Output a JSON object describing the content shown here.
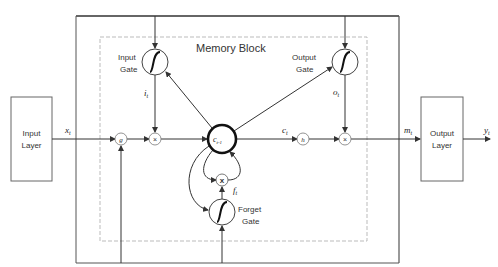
{
  "diagram": {
    "title": "Memory Block",
    "input_layer": {
      "line1": "Input",
      "line2": "Layer"
    },
    "output_layer": {
      "line1": "Output",
      "line2": "Layer"
    },
    "input_gate": {
      "line1": "Input",
      "line2": "Gate",
      "signal": "i",
      "sub": "t"
    },
    "output_gate": {
      "line1": "Output",
      "line2": "Gate",
      "signal": "o",
      "sub": "t"
    },
    "forget_gate": {
      "line1": "Forget",
      "line2": "Gate",
      "signal": "f",
      "sub": "t"
    },
    "cell": {
      "label": "c",
      "sub": "t-1"
    },
    "signals": {
      "x": "x",
      "x_sub": "t",
      "c": "c",
      "c_sub": "t",
      "m": "m",
      "m_sub": "t",
      "y": "y",
      "y_sub": "t"
    },
    "nodes": {
      "g": "g",
      "h": "h",
      "mult": "×",
      "forget_mult": "x"
    },
    "colors": {
      "line": "#333333",
      "dashed": "#bbbbbb",
      "box": "#555555"
    }
  }
}
